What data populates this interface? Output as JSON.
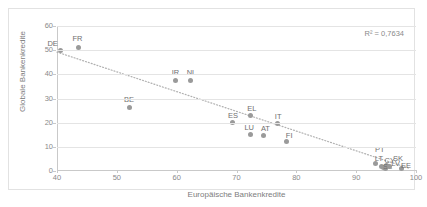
{
  "chart_data": {
    "type": "scatter",
    "title": "",
    "xlabel": "Europäische Bankenkredite",
    "ylabel": "Globale Bankenkredite",
    "xlim": [
      40,
      100
    ],
    "ylim": [
      0,
      60
    ],
    "xticks": [
      40,
      50,
      60,
      70,
      80,
      90,
      100
    ],
    "yticks": [
      0,
      10,
      20,
      30,
      40,
      50,
      60
    ],
    "grid": true,
    "legend": "none",
    "annotations": [
      {
        "name": "r-squared",
        "text": "R² = 0,7634"
      }
    ],
    "trendline": {
      "type": "linear-dotted",
      "x_start": 40.0,
      "y_start": 49.2,
      "x_end": 99.0,
      "y_end": 1.0,
      "color": "#b0b0b0"
    },
    "point_color": "#9a9a9a",
    "points": [
      {
        "label": "DE",
        "x": 40.6,
        "y": 49.8,
        "label_dx": -8,
        "label_dy": -11
      },
      {
        "label": "FR",
        "x": 43.6,
        "y": 51.2,
        "label_dx": -1,
        "label_dy": -12
      },
      {
        "label": "BE",
        "x": 52.2,
        "y": 26.2,
        "label_dx": -1,
        "label_dy": -12
      },
      {
        "label": "IR",
        "x": 59.8,
        "y": 37.3,
        "label_dx": 0,
        "label_dy": -12
      },
      {
        "label": "NL",
        "x": 62.3,
        "y": 37.3,
        "label_dx": 1,
        "label_dy": -12
      },
      {
        "label": "ES",
        "x": 69.4,
        "y": 20.0,
        "label_dx": 0,
        "label_dy": -11
      },
      {
        "label": "EL",
        "x": 72.4,
        "y": 22.9,
        "label_dx": 1,
        "label_dy": -11
      },
      {
        "label": "LU",
        "x": 72.3,
        "y": 15.3,
        "label_dx": -1,
        "label_dy": -10
      },
      {
        "label": "AT",
        "x": 74.5,
        "y": 14.7,
        "label_dx": 2,
        "label_dy": -10
      },
      {
        "label": "IT",
        "x": 76.8,
        "y": 19.5,
        "label_dx": 1,
        "label_dy": -11
      },
      {
        "label": "FI",
        "x": 78.3,
        "y": 12.2,
        "label_dx": 3,
        "label_dy": -10
      },
      {
        "label": "PT",
        "x": 93.3,
        "y": 3.2,
        "label_dx": 4,
        "label_dy": -17
      },
      {
        "label": "LT",
        "x": 94.3,
        "y": 2.0,
        "label_dx": -3,
        "label_dy": -11
      },
      {
        "label": "CY",
        "x": 94.6,
        "y": 1.3,
        "label_dx": 6,
        "label_dy": -11
      },
      {
        "label": "SK",
        "x": 95.0,
        "y": 2.2,
        "label_dx": 12,
        "label_dy": -11
      },
      {
        "label": "SL",
        "x": 94.9,
        "y": 1.0,
        "label_dx": 2,
        "label_dy": -6
      },
      {
        "label": "LV",
        "x": 95.6,
        "y": 1.9,
        "label_dx": 6,
        "label_dy": -6
      },
      {
        "label": "EE",
        "x": 97.5,
        "y": 0.9,
        "label_dx": 5,
        "label_dy": -7
      }
    ]
  }
}
